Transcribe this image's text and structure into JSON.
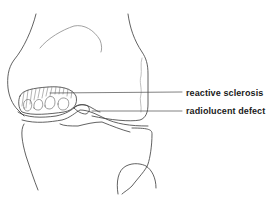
{
  "figure": {
    "labels": [
      {
        "id": "reactive-sclerosis",
        "text": "reactive sclerosis"
      },
      {
        "id": "radiolucent-defect",
        "text": "radiolucent defect"
      }
    ],
    "colors": {
      "line": "#3a3a3a",
      "faint_line": "#9a9a9a",
      "background": "#ffffff",
      "text": "#1a1a1a"
    }
  }
}
